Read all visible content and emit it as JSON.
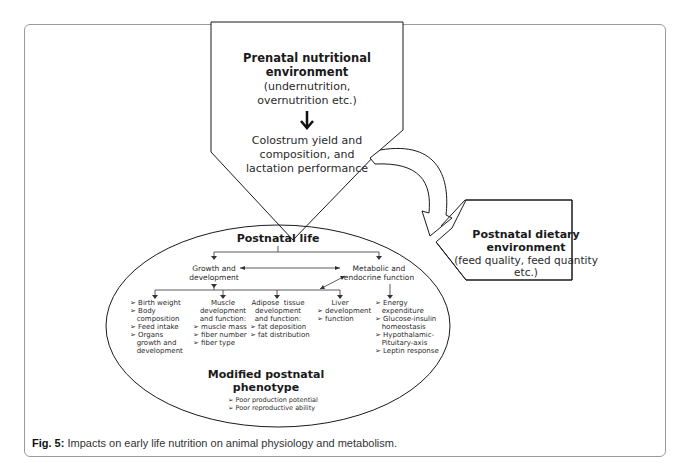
{
  "prenatal": {
    "title_line1": "Prenatal nutritional",
    "title_line2": "environment",
    "sub_line1": "(undernutrition,",
    "sub_line2": "overnutrition etc.)",
    "arrow": "↓",
    "colostrum_line1": "Colostrum yield and",
    "colostrum_line2": "composition, and",
    "colostrum_line3": "lactation performance"
  },
  "postnatal_dietary": {
    "title_line1": "Postnatal dietary",
    "title_line2": "environment",
    "sub_line1": "(feed quality, feed quantity",
    "sub_line2": "etc.)"
  },
  "postnatal_life": {
    "title": "Postnatal life",
    "growth": {
      "line1": "Growth and",
      "line2": "development"
    },
    "metabolic": {
      "line1": "Metabolic and",
      "line2": "endocrine  function"
    },
    "columns": [
      {
        "lines": [
          "➢ Birth weight",
          "➢ Body",
          "   composition",
          "➢ Feed intake",
          "➢ Organs",
          "   growth and",
          "   development"
        ]
      },
      {
        "heading": [
          "Muscle",
          "development",
          "and function:"
        ],
        "lines": [
          "➢ muscle mass",
          "➢ fiber number",
          "➢ fiber type"
        ]
      },
      {
        "heading": [
          "Adipose  tissue",
          "development",
          "and function:"
        ],
        "lines": [
          "➢ fat deposition",
          "➢ fat distribution"
        ]
      },
      {
        "heading": [
          "Liver"
        ],
        "lines": [
          "➢ development",
          "➢ function"
        ]
      },
      {
        "lines": [
          "➢ Energy",
          "   expenditure",
          "➢ Glucose-insulin",
          "   homeostasis",
          "➢ Hypothalamic-",
          "   Pituitary-axis",
          "➢ Leptin response"
        ]
      }
    ],
    "phenotype": {
      "title_line1": "Modified postnatal",
      "title_line2": "phenotype",
      "items": [
        "➢ Poor production potential",
        "➢ Poor reproductive ability"
      ]
    }
  },
  "caption": {
    "label": "Fig. 5:",
    "text": " Impacts on early life nutrition on animal physiology and metabolism."
  },
  "colors": {
    "stroke": "#1a1a1a",
    "frame": "#9a9a9a",
    "text": "#2a2a2a"
  }
}
